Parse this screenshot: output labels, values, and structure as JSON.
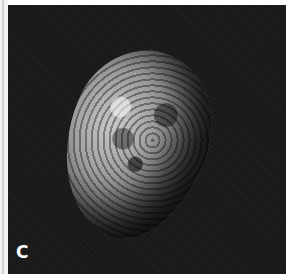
{
  "figure": {
    "panel_label": "C",
    "colors": {
      "background": "#1a1a1a",
      "frame": "#ffffff",
      "label": "#ffffff"
    }
  }
}
